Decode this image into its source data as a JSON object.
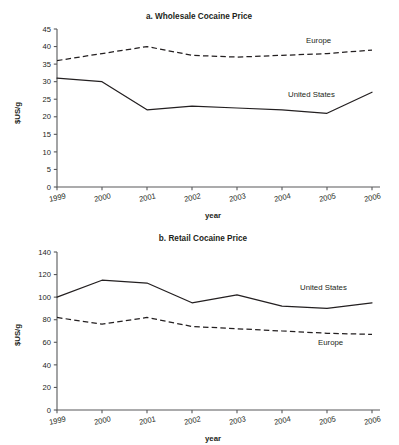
{
  "figure": {
    "ylabel": "$US/g",
    "xlabel": "year",
    "series_label_us": "United States",
    "series_label_eu": "Europe"
  },
  "chart_data": [
    {
      "type": "line",
      "title": "a. Wholesale Cocaine Price",
      "xlabel": "year",
      "ylabel": "$US/g",
      "categories": [
        "1999",
        "2000",
        "2001",
        "2002",
        "2003",
        "2004",
        "2005",
        "2006"
      ],
      "x": [
        1999,
        2000,
        2001,
        2002,
        2003,
        2004,
        2005,
        2006
      ],
      "ylim": [
        0,
        45
      ],
      "yticks": [
        0,
        5,
        10,
        15,
        20,
        25,
        30,
        35,
        40,
        45
      ],
      "grid": false,
      "legend_position": "inline-annotation",
      "series": [
        {
          "name": "United States",
          "style": "solid",
          "color": "#231f20",
          "values": [
            31,
            30,
            22,
            23,
            22.5,
            22,
            21,
            27
          ]
        },
        {
          "name": "Europe",
          "style": "dashed",
          "color": "#231f20",
          "values": [
            36,
            38,
            40,
            37.5,
            37,
            37.5,
            38,
            39
          ]
        }
      ],
      "annotations": [
        {
          "text": "Europe",
          "series": "Europe"
        },
        {
          "text": "United States",
          "series": "United States"
        }
      ]
    },
    {
      "type": "line",
      "title": "b. Retail Cocaine Price",
      "xlabel": "year",
      "ylabel": "$US/g",
      "categories": [
        "1999",
        "2000",
        "2001",
        "2002",
        "2003",
        "2004",
        "2005",
        "2006"
      ],
      "x": [
        1999,
        2000,
        2001,
        2002,
        2003,
        2004,
        2005,
        2006
      ],
      "ylim": [
        0,
        140
      ],
      "yticks": [
        0,
        20,
        40,
        60,
        80,
        100,
        120,
        140
      ],
      "grid": false,
      "legend_position": "inline-annotation",
      "series": [
        {
          "name": "United States",
          "style": "solid",
          "color": "#231f20",
          "values": [
            100,
            115,
            112.5,
            95,
            102,
            92,
            90,
            95
          ]
        },
        {
          "name": "Europe",
          "style": "dashed",
          "color": "#231f20",
          "values": [
            82,
            76,
            82,
            74,
            72,
            70,
            68,
            67
          ]
        }
      ],
      "annotations": [
        {
          "text": "United States",
          "series": "United States"
        },
        {
          "text": "Europe",
          "series": "Europe"
        }
      ]
    }
  ]
}
